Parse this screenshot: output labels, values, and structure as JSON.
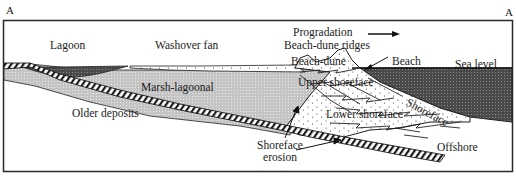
{
  "figure": {
    "corner_left": "A",
    "corner_right": "A"
  },
  "labels": {
    "lagoon": "Lagoon",
    "washover_fan": "Washover fan",
    "progradation": "Progradation",
    "beach_dune_ridges": "Beach-dune ridges",
    "beach_dune": "Beach-dune",
    "beach": "Beach",
    "sea_level": "Sea level",
    "marsh_lagoonal": "Marsh-lagoonal",
    "upper_shoreface": "Upper shoreface",
    "shoreface": "Shoreface",
    "lower_shoreface": "Lower shoreface",
    "older_deposits": "Older deposits",
    "shoreface_erosion_1": "Shoreface",
    "shoreface_erosion_2": "erosion",
    "offshore": "Offshore"
  },
  "colors": {
    "frame": "#2a2a2a",
    "sea": "#5a5a5a",
    "lagoon_water": "#6a6a6a",
    "marsh": "#c8c8c8",
    "sand": "#f4f4f4",
    "ink": "#1a1a1a"
  }
}
